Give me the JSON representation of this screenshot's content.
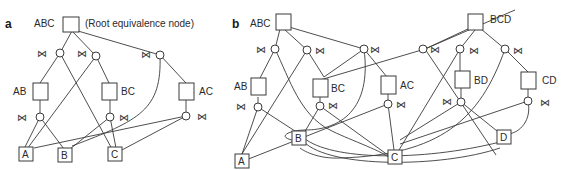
{
  "panel_a": {
    "label": "a",
    "root_label": "ABC",
    "root_note": "(Root equivalence node)",
    "nodes": {
      "AB": "AB",
      "BC": "BC",
      "AC": "AC",
      "A": "A",
      "B": "B",
      "C": "C"
    },
    "join_symbol": "⋈"
  },
  "panel_b": {
    "label": "b",
    "roots": {
      "ABC": "ABC",
      "BCD": "BCD"
    },
    "nodes": {
      "AB": "AB",
      "BC": "BC",
      "AC": "AC",
      "BD": "BD",
      "CD": "CD",
      "A": "A",
      "B": "B",
      "C": "C",
      "D": "D"
    },
    "join_symbol": "⋈"
  }
}
